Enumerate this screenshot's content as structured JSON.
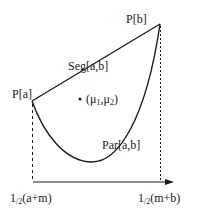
{
  "diagram": {
    "points": {
      "pa": {
        "label": "P[a]",
        "x": 32,
        "y": 101
      },
      "pb": {
        "label": "P[b]",
        "x": 160,
        "y": 24
      }
    },
    "segment": {
      "label": "Seg[a,b]"
    },
    "parabola": {
      "label": "Par[a,b]"
    },
    "mean_point": {
      "label_open": "(",
      "mu": "μ",
      "sub1": "1",
      "comma": ",",
      "sub2": "2",
      "label_close": ")"
    },
    "axis": {
      "left_tick": {
        "one": "1",
        "slash_two": "/2",
        "expr": "(a+m)"
      },
      "right_tick": {
        "one": "1",
        "slash_two": "/2",
        "expr": "(m+b)"
      }
    },
    "colors": {
      "stroke": "#1a1a1a",
      "background": "#ffffff"
    }
  }
}
